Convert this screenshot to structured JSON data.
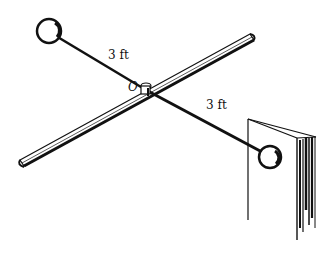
{
  "diagram": {
    "type": "physics-figure",
    "labels": {
      "upper_arm_length": "3 ft",
      "lower_arm_length": "3 ft",
      "pivot": "O"
    },
    "colors": {
      "ink": "#111111",
      "background": "#ffffff"
    }
  }
}
